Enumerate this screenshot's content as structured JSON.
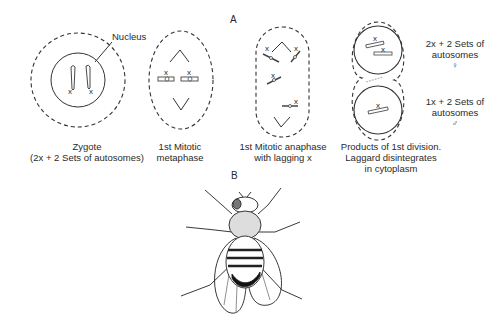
{
  "figure": {
    "panel_a_label": "A",
    "panel_b_label": "B",
    "nucleus_label": "Nucleus",
    "chromosome_mark": "x",
    "stages": [
      {
        "id": "zygote",
        "caption_lines": [
          "Zygote",
          "(2x + 2 Sets of autosomes)"
        ]
      },
      {
        "id": "metaphase",
        "caption_lines": [
          "1st Mitotic",
          "metaphase"
        ]
      },
      {
        "id": "anaphase",
        "caption_lines": [
          "1st Mitotic anaphase",
          "with lagging x"
        ]
      },
      {
        "id": "products",
        "caption_lines": [
          "Products of 1st division.",
          "Laggard disintegrates",
          "in cytoplasm"
        ]
      }
    ],
    "daughter_cells": [
      {
        "id": "female-cell",
        "label_lines": [
          "2x + 2 Sets of",
          "autosomes"
        ],
        "sex_symbol": "♀"
      },
      {
        "id": "male-cell",
        "label_lines": [
          "1x + 2 Sets of",
          "autosomes"
        ],
        "sex_symbol": "♂"
      }
    ],
    "panel_b_subject": "fruit fly"
  }
}
